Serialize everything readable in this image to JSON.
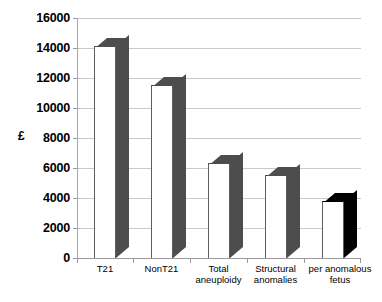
{
  "chart_data": {
    "type": "bar",
    "title": "",
    "xlabel": "",
    "ylabel": "£",
    "categories": [
      "T21",
      "NonT21",
      "Total aneuploidy",
      "Structural anomalies",
      "per anomalous fetus"
    ],
    "category_lines": [
      [
        "T21"
      ],
      [
        "NonT21"
      ],
      [
        "Total",
        "aneuploidy"
      ],
      [
        "Structural",
        "anomalies"
      ],
      [
        "per anomalous",
        "fetus"
      ]
    ],
    "values": [
      14100,
      11500,
      6300,
      5500,
      3800
    ],
    "ylim": [
      0,
      16000
    ],
    "ytick_step": 2000,
    "ytick_labels": [
      "16000",
      "14000",
      "12000",
      "10000",
      "8000",
      "6000",
      "4000",
      "2000",
      "0"
    ],
    "ytick_values": [
      16000,
      14000,
      12000,
      10000,
      8000,
      6000,
      4000,
      2000,
      0
    ],
    "grid": true,
    "legend": "none",
    "bar_colors": [
      "#4d4d4d",
      "#4d4d4d",
      "#4d4d4d",
      "#4d4d4d",
      "#000000"
    ],
    "bar_face_color": "#ffffff",
    "gridline_color": "#c9c9c9",
    "axis_color": "#9a9a9a",
    "style": "3d-column"
  }
}
